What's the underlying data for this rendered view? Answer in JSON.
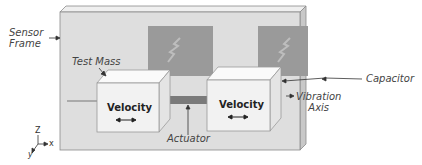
{
  "diagram": {
    "labels": {
      "sensor_frame": [
        "Sensor",
        "Frame"
      ],
      "test_mass": "Test Mass",
      "capacitor": "Capacitor",
      "vibration_axis": [
        "Vibration",
        "Axis"
      ],
      "actuator": "Actuator",
      "velocity_left": "Velocity",
      "velocity_right": "Velocity"
    },
    "axes": {
      "z": "Z",
      "x": "x",
      "y": "y"
    },
    "colors": {
      "frame": "#dedede",
      "frame_edge": "#8a8a8a",
      "plate": "#9a9a9a",
      "mass_front": "#f2f2f2",
      "mass_top": "#fafafa",
      "mass_side": "#e4e4e4",
      "actuator": "#7a7a7a",
      "text": "#444444"
    }
  }
}
